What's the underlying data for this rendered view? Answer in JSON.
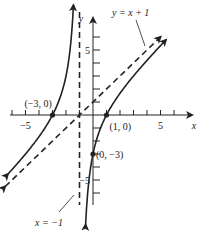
{
  "chart_data": {
    "type": "line",
    "title": "",
    "xlabel": "x",
    "ylabel": "y",
    "xlim": [
      -6.5,
      7
    ],
    "ylim": [
      -7,
      7
    ],
    "grid": false,
    "x_tick_labels": [
      {
        "value": -5,
        "label": "−5"
      },
      {
        "value": 5,
        "label": "5"
      }
    ],
    "y_tick_labels": [
      {
        "value": 5,
        "label": "5"
      },
      {
        "value": -5,
        "label": "−5"
      }
    ],
    "x_ticks": [
      -6,
      -5,
      -4,
      -3,
      -2,
      -1,
      1,
      2,
      3,
      4,
      5,
      6
    ],
    "y_ticks": [
      -6,
      -5,
      -4,
      -3,
      -2,
      -1,
      1,
      2,
      3,
      4,
      5,
      6
    ],
    "series": [
      {
        "name": "f(x) = x + 1 − 4/(x + 1)",
        "style": "solid",
        "color": "#222222",
        "branches": [
          {
            "x_from": -6.3,
            "x_to": -1.45
          },
          {
            "x_from": -0.55,
            "x_to": 5.4
          }
        ]
      },
      {
        "name": "y = x + 1",
        "style": "dashed",
        "color": "#222222",
        "x_from": -6.5,
        "x_to": 5.0
      },
      {
        "name": "x = −1",
        "style": "dashed",
        "color": "#222222",
        "vertical_x": -1,
        "y_from": -7,
        "y_to": 7
      }
    ],
    "points": [
      {
        "x": -3,
        "y": 0,
        "label": "(−3, 0)"
      },
      {
        "x": 1,
        "y": 0,
        "label": "(1, 0)"
      },
      {
        "x": 0,
        "y": -3,
        "label": "(0, −3)"
      }
    ],
    "annotations": [
      {
        "text": "y = x + 1",
        "points_to": "slant asymptote",
        "position": "top-right"
      },
      {
        "text": "x = −1",
        "points_to": "vertical asymptote",
        "position": "bottom-left"
      }
    ]
  }
}
